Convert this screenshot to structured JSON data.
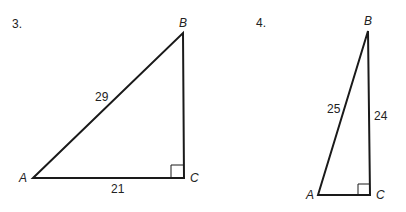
{
  "problems": [
    {
      "number": "3.",
      "vertices": {
        "A": "A",
        "B": "B",
        "C": "C"
      },
      "sides": {
        "hypotenuse_AB": "29",
        "base_AC": "21"
      },
      "right_angle_at": "C"
    },
    {
      "number": "4.",
      "vertices": {
        "A": "A",
        "B": "B",
        "C": "C"
      },
      "sides": {
        "hypotenuse_AB": "25",
        "leg_BC": "24"
      },
      "right_angle_at": "C"
    }
  ],
  "colors": {
    "line": "#1a1a1a",
    "text": "#222222"
  }
}
